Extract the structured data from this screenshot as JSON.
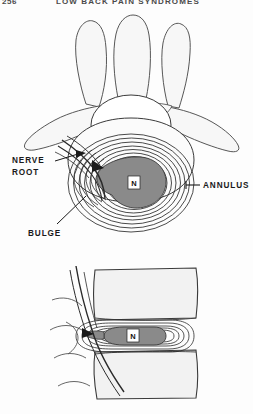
{
  "page": {
    "folio": "256",
    "running_title": "LOW BACK PAIN SYNDROMES",
    "background_color": "#fdfdfd"
  },
  "figure": {
    "caption": "",
    "views": [
      {
        "name": "axial-view",
        "description": "Axial cross-section of lumbar vertebra with bulging intervertebral disc"
      },
      {
        "name": "sagittal-view",
        "description": "Sagittal section of two vertebral bodies with bulging disc"
      }
    ],
    "labels": [
      {
        "id": "nerve-root",
        "text_line1": "NERVE",
        "text_line2": "ROOT",
        "x": 12,
        "y": 160
      },
      {
        "id": "annulus",
        "text": "ANNULUS",
        "x": 196,
        "y": 185
      },
      {
        "id": "bulge",
        "text": "BULGE",
        "x": 28,
        "y": 232
      }
    ],
    "nucleus": {
      "label": "N",
      "axial_x": 134,
      "axial_y": 183,
      "sagittal_x": 133,
      "sagittal_y": 334
    },
    "colors": {
      "nucleus_fill": "#8a8a8a",
      "bone_fill": "#f2f2f2",
      "outline": "#333333",
      "annulus_line": "#2b2b2b",
      "label_text": "#1a1a1a",
      "runhead_text": "#4a4a4a"
    }
  }
}
